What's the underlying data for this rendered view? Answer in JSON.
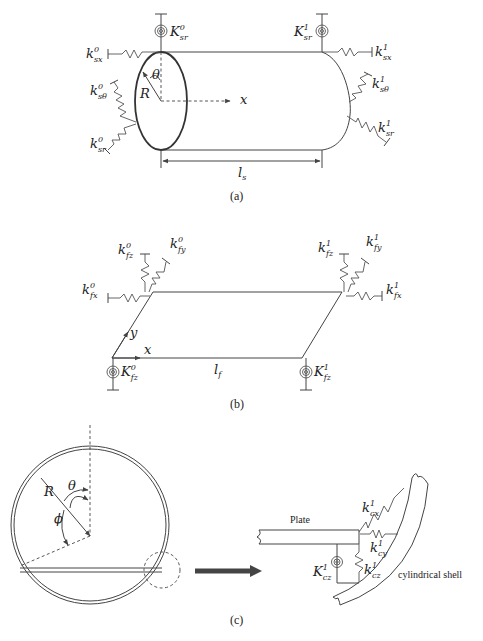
{
  "figure": {
    "panel_a": {
      "caption": "(a)",
      "title": "Cylindrical shell with elastic boundary springs",
      "labels": {
        "K_sr0": {
          "base": "K",
          "sup": "0",
          "sub": "sr"
        },
        "K_sr1": {
          "base": "K",
          "sup": "1",
          "sub": "sr"
        },
        "k_sx0": {
          "base": "k",
          "sup": "0",
          "sub": "sx"
        },
        "k_sx1": {
          "base": "k",
          "sup": "1",
          "sub": "sx"
        },
        "k_stheta0": {
          "base": "k",
          "sup": "0",
          "sub": "sθ"
        },
        "k_stheta1": {
          "base": "k",
          "sup": "1",
          "sub": "sθ"
        },
        "k_sr0": {
          "base": "k",
          "sup": "0",
          "sub": "sr"
        },
        "k_sr1": {
          "base": "k",
          "sup": "1",
          "sub": "sr"
        },
        "theta": "θ",
        "radius": "R",
        "axis_x": "x",
        "length": {
          "base": "l",
          "sub": "s"
        }
      }
    },
    "panel_b": {
      "caption": "(b)",
      "title": "Plate with elastic boundary springs",
      "labels": {
        "k_fz0": {
          "base": "k",
          "sup": "0",
          "sub": "fz"
        },
        "k_fy0": {
          "base": "k",
          "sup": "0",
          "sub": "fy"
        },
        "k_fx0": {
          "base": "k",
          "sup": "0",
          "sub": "fx"
        },
        "k_fz1": {
          "base": "k",
          "sup": "1",
          "sub": "fz"
        },
        "k_fy1": {
          "base": "k",
          "sup": "1",
          "sub": "fy"
        },
        "k_fx1": {
          "base": "k",
          "sup": "1",
          "sub": "fx"
        },
        "K_fz0": {
          "base": "K",
          "sup": "0",
          "sub": "fz"
        },
        "K_fz1": {
          "base": "K",
          "sup": "1",
          "sub": "fz"
        },
        "axis_x": "x",
        "axis_y": "y",
        "length": {
          "base": "l",
          "sub": "f"
        }
      }
    },
    "panel_c": {
      "caption": "(c)",
      "title": "Plate-shell coupling connection",
      "labels": {
        "radius": "R",
        "theta": "θ",
        "phi": "ϕ",
        "plate": "Plate",
        "shell": "cylindrical shell",
        "k_cx1": {
          "base": "k",
          "sup": "1",
          "sub": "cx"
        },
        "k_cy1": {
          "base": "k",
          "sup": "1",
          "sub": "cy"
        },
        "k_cz1": {
          "base": "k",
          "sup": "1",
          "sub": "cz"
        },
        "K_cz1": {
          "base": "K",
          "sup": "1",
          "sub": "cz"
        }
      }
    }
  }
}
